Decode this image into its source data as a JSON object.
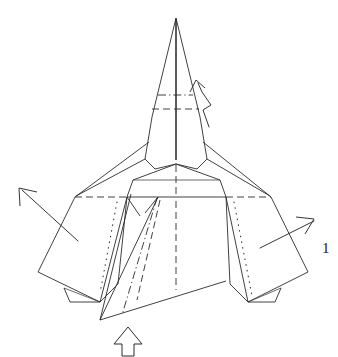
{
  "figure": {
    "kind": "origami-folding-diagram",
    "step_number_label": "1",
    "background_color": "#ffffff",
    "ink_color": "#2b2b2b",
    "canvas": {
      "width": 338,
      "height": 357
    }
  },
  "labels": {
    "step_number": "1"
  },
  "annotations": {
    "crimp_arrow": {
      "name": "crimp-fold-arrow",
      "description": "zig-zag pleat arrow beside the nose pointing up-left",
      "tip": [
        196,
        80
      ]
    },
    "left_wing_arrow": {
      "name": "left-wing-unfold-arrow",
      "description": "straight arrow from left wing pointing up-left",
      "tip": [
        20,
        188
      ]
    },
    "right_wing_arrow": {
      "name": "right-wing-unfold-arrow",
      "description": "straight arrow from right wing pointing up-right",
      "tip": [
        312,
        219
      ]
    },
    "push_arrow": {
      "name": "push-here-hollow-arrow",
      "description": "outline arrow at bottom pointing up into the keel",
      "tip": [
        128,
        328
      ]
    }
  },
  "fold_legend": {
    "solid": "visible edge",
    "dashed": "valley fold",
    "dash_dot": "mountain fold",
    "dotted": "hidden / behind edge"
  },
  "geometry": {
    "nose_apex": [
      176,
      18
    ],
    "mountain_crease_nose": {
      "y": 95,
      "x1": 158,
      "x2": 193
    },
    "valley_crease_nose": {
      "y": 109,
      "x1": 153,
      "x2": 199
    },
    "wing_span_line": {
      "y": 197,
      "x1": 75,
      "x2": 271
    },
    "left_wing_tip": [
      75,
      197
    ],
    "right_wing_tip": [
      271,
      197
    ],
    "keel_bottom": [
      100,
      320
    ]
  }
}
